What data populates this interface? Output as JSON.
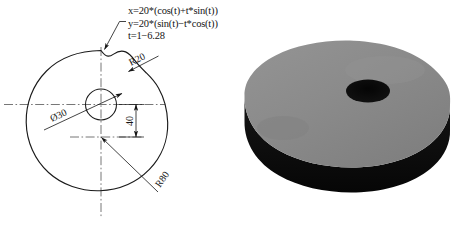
{
  "figure": {
    "background_color": "#ffffff",
    "stroke_color": "#1a1a1a",
    "centerline_color": "#4a4a4a"
  },
  "drawing": {
    "title": "Cam profile engineering drawing",
    "equations": [
      "x=20*(cos(t)+t*sin(t))",
      "y=20*(sin(t)−t*cos(t))",
      "t=1−6.28"
    ],
    "labels": {
      "radius_notch": "R20",
      "radius_outer": "R80",
      "hole_diameter": "̀30",
      "hole_diameter_display": "Ø30",
      "offset_dimension": "40"
    },
    "annotations": [
      {
        "name": "equation-leader",
        "text": "leader from equations to profile curve"
      },
      {
        "name": "r20-leader",
        "text": "R20 leader arrow to notch fillet"
      },
      {
        "name": "r80-leader",
        "text": "R80 leader arrow to outer arc"
      },
      {
        "name": "diameter-leader",
        "text": "Ø30 leader arrow to center hole"
      }
    ]
  },
  "model": {
    "title": "3D shaded cam disc",
    "top_face_color": "#8c8c8c",
    "rim_color": "#0d0d0d",
    "hole_color": "#0a0a0a",
    "shadow_color": "#6f6f6f"
  }
}
